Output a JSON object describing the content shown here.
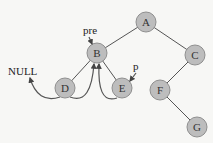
{
  "diagram": {
    "colors": {
      "node_fill": "#bdbdbd",
      "node_stroke": "#8f8f8f",
      "line": "#555555",
      "background": "#f7f7f5"
    },
    "nodes": [
      {
        "id": "A",
        "label": "A",
        "x": 146,
        "y": 22
      },
      {
        "id": "B",
        "label": "B",
        "x": 97,
        "y": 53
      },
      {
        "id": "C",
        "label": "C",
        "x": 195,
        "y": 55
      },
      {
        "id": "D",
        "label": "D",
        "x": 65,
        "y": 88
      },
      {
        "id": "E",
        "label": "E",
        "x": 122,
        "y": 88
      },
      {
        "id": "F",
        "label": "F",
        "x": 160,
        "y": 90
      },
      {
        "id": "G",
        "label": "G",
        "x": 197,
        "y": 127
      }
    ],
    "edges": [
      {
        "from": "A",
        "to": "B"
      },
      {
        "from": "A",
        "to": "C"
      },
      {
        "from": "B",
        "to": "D"
      },
      {
        "from": "B",
        "to": "E"
      },
      {
        "from": "C",
        "to": "F"
      },
      {
        "from": "F",
        "to": "G"
      }
    ],
    "threads": [
      {
        "from": "D",
        "to": "NULL",
        "kind": "left-thread"
      },
      {
        "from": "D",
        "to": "B",
        "kind": "right-thread"
      },
      {
        "from": "E",
        "to": "B",
        "kind": "left-thread"
      }
    ],
    "labels": {
      "null": "NULL",
      "pre": "pre",
      "p": "p"
    }
  }
}
